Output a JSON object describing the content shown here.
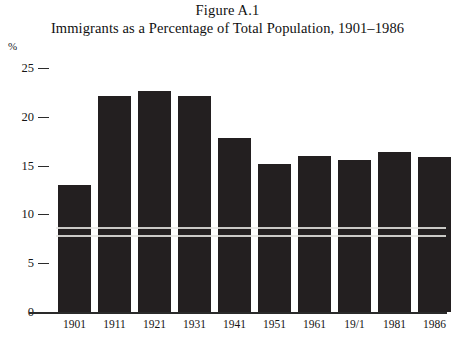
{
  "figure": {
    "caption": "Figure A.1",
    "title": "Immigrants as a Percentage of Total Population, 1901–1986",
    "y_unit": "%"
  },
  "colors": {
    "bar": "#231f20",
    "axis": "#2a2a2a",
    "text": "#151515",
    "background": "#ffffff",
    "scanline": "#e8e7e4"
  },
  "chart_data": {
    "type": "bar",
    "title": "Immigrants as a Percentage of Total Population, 1901–1986",
    "subtitle": "Figure A.1",
    "xlabel": "",
    "ylabel": "%",
    "ylim": [
      0,
      25
    ],
    "yticks": [
      0,
      5,
      10,
      15,
      20,
      25
    ],
    "ytick_labels": [
      "0",
      "5",
      "10",
      "15",
      "20",
      "25"
    ],
    "grid": false,
    "legend": null,
    "categories": [
      "1901",
      "1911",
      "1921",
      "1931",
      "1941",
      "1951",
      "1961",
      "19/1",
      "1981",
      "1986"
    ],
    "values": [
      13.0,
      22.1,
      22.6,
      22.1,
      17.8,
      15.2,
      16.0,
      15.6,
      16.4,
      15.9
    ]
  }
}
